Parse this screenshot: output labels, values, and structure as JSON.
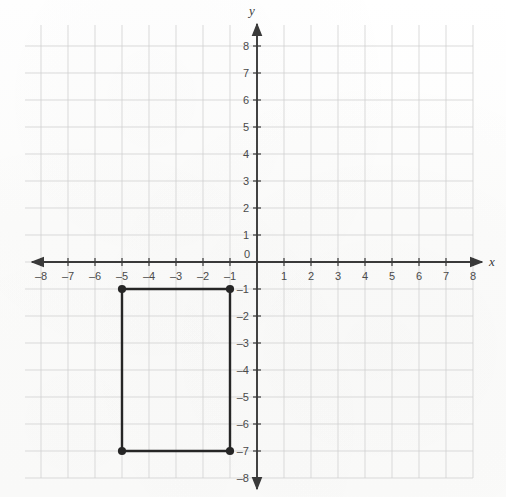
{
  "figure": {
    "kind": "coordinate-plane-graph",
    "background_color": "#fdfdfc",
    "grid_color": "#cfcfcf",
    "axis_color": "#3a3a3a",
    "shape_color": "#262626"
  },
  "axes": {
    "x_axis_label": "x",
    "y_axis_label": "y",
    "origin_label": "0",
    "x_min": -8,
    "x_max": 8,
    "y_min": -8,
    "y_max": 8,
    "x_tick_labels": [
      "-8",
      "-7",
      "-6",
      "-5",
      "-4",
      "-3",
      "-2",
      "-1",
      "1",
      "2",
      "3",
      "4",
      "5",
      "6",
      "7",
      "8"
    ],
    "y_tick_labels": [
      "8",
      "7",
      "6",
      "5",
      "4",
      "3",
      "2",
      "1",
      "-1",
      "-2",
      "-3",
      "-4",
      "-5",
      "-6",
      "-7",
      "-8"
    ],
    "x_arrow_left": true,
    "x_arrow_right": true,
    "y_arrow_up": true,
    "y_arrow_down": true
  },
  "chart_data": {
    "type": "scatter",
    "title": "",
    "xlabel": "x",
    "ylabel": "y",
    "xlim": [
      -8.5,
      8.5
    ],
    "ylim": [
      -8.5,
      8.5
    ],
    "grid": true,
    "legend": "none",
    "xticks": [
      -8,
      -7,
      -6,
      -5,
      -4,
      -3,
      -2,
      -1,
      0,
      1,
      2,
      3,
      4,
      5,
      6,
      7,
      8
    ],
    "yticks": [
      -8,
      -7,
      -6,
      -5,
      -4,
      -3,
      -2,
      -1,
      0,
      1,
      2,
      3,
      4,
      5,
      6,
      7,
      8
    ],
    "shapes": [
      {
        "name": "rectangle",
        "closed": true,
        "vertices": [
          {
            "label": "A",
            "x": -5,
            "y": -1
          },
          {
            "label": "B",
            "x": -1,
            "y": -1
          },
          {
            "label": "C",
            "x": -1,
            "y": -7
          },
          {
            "label": "D",
            "x": -5,
            "y": -7
          }
        ],
        "width_units": 4,
        "height_units": 6,
        "marker": "filled-circle"
      }
    ]
  },
  "geometry": {
    "origin_px": {
      "x": 257,
      "y": 262
    },
    "unit_px": 27,
    "grid_left_px": 25,
    "grid_top_px": 25,
    "grid_right_px": 473,
    "grid_bottom_px": 478
  }
}
